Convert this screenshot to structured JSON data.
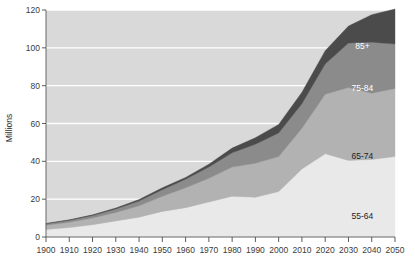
{
  "chart_data": {
    "type": "area",
    "title": "",
    "subtitle": "",
    "xlabel": "",
    "ylabel": "Millions",
    "stacked": true,
    "grid": true,
    "legend_position": "inline-labels",
    "xlim": [
      1900,
      2050
    ],
    "ylim": [
      0,
      120
    ],
    "yticks": [
      0,
      20,
      40,
      60,
      80,
      100,
      120
    ],
    "ytick_labels": [
      "0",
      "20",
      "40",
      "60",
      "80",
      "100",
      "120"
    ],
    "x": [
      1900,
      1910,
      1920,
      1930,
      1940,
      1950,
      1960,
      1970,
      1980,
      1990,
      2000,
      2010,
      2020,
      2030,
      2040,
      2050
    ],
    "xtick_labels": [
      "1900",
      "1910",
      "1920",
      "1930",
      "1940",
      "1950",
      "1960",
      "1970",
      "1980",
      "1990",
      "2000",
      "2010",
      "2020",
      "2030",
      "2040",
      "2050"
    ],
    "series": [
      {
        "name": "55-64",
        "label": "55-64",
        "color": "#e9e9e9",
        "label_color": "#1e1e1e",
        "values": [
          4.0,
          5.0,
          6.5,
          8.5,
          10.5,
          13.5,
          15.5,
          18.5,
          21.5,
          21.0,
          24.0,
          36.0,
          44.0,
          40.5,
          41.0,
          42.5
        ]
      },
      {
        "name": "65-74",
        "label": "65-74",
        "color": "#b2b2b2",
        "label_color": "#1e1e1e",
        "values": [
          2.2,
          2.8,
          3.5,
          4.5,
          6.0,
          8.0,
          10.5,
          12.5,
          15.5,
          18.0,
          18.5,
          21.5,
          31.5,
          38.5,
          35.0,
          36.0
        ]
      },
      {
        "name": "75-84",
        "label": "75-84",
        "color": "#8b8b8b",
        "label_color": "#ffffff",
        "values": [
          0.8,
          1.0,
          1.3,
          1.8,
          2.5,
          3.5,
          4.5,
          6.0,
          7.5,
          10.0,
          12.5,
          13.0,
          16.0,
          23.5,
          27.0,
          23.5
        ]
      },
      {
        "name": "85+",
        "label": "85+",
        "color": "#4b4b4b",
        "label_color": "#ffffff",
        "values": [
          0.2,
          0.3,
          0.4,
          0.5,
          0.8,
          1.0,
          1.0,
          1.5,
          2.5,
          3.5,
          4.5,
          6.0,
          7.0,
          9.0,
          14.5,
          18.5
        ]
      }
    ],
    "totals": [
      7.2,
      9.1,
      11.7,
      15.3,
      19.8,
      26.0,
      31.5,
      38.5,
      47.0,
      52.5,
      59.5,
      76.5,
      98.5,
      111.5,
      117.5,
      120.5
    ],
    "series_label_positions": [
      {
        "series": "55-64",
        "x": 2036,
        "y": 11
      },
      {
        "series": "65-74",
        "x": 2036,
        "y": 43
      },
      {
        "series": "75-84",
        "x": 2036,
        "y": 79
      },
      {
        "series": "85+",
        "x": 2036,
        "y": 101
      }
    ],
    "plot_background": "#d9d9d9",
    "gridline_color": "#ffffff"
  }
}
